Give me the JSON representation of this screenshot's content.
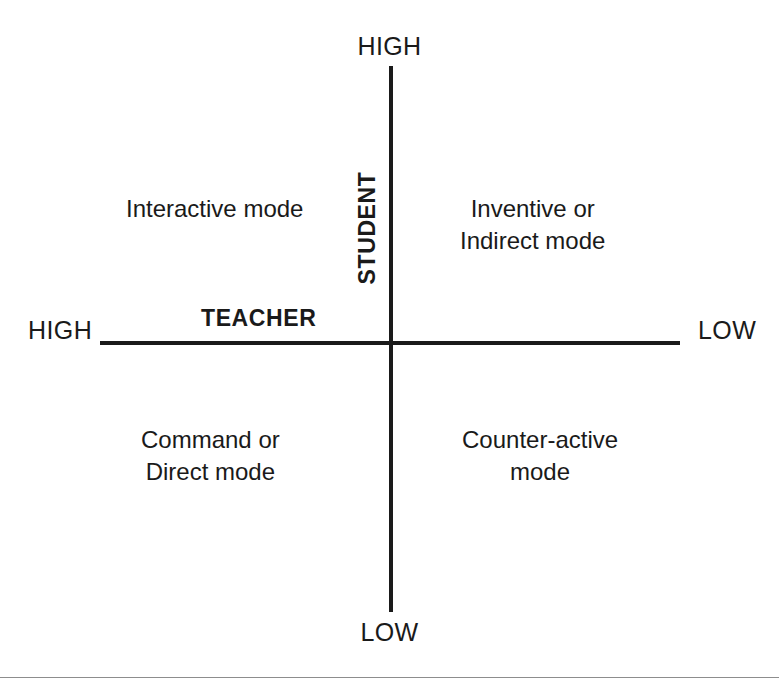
{
  "figure": {
    "type": "2x2-quadrant-matrix",
    "background_color": "#ffffff",
    "ink_color": "#1a1a1a",
    "rule_color": "#8d8d8d"
  },
  "axes": {
    "vertical": {
      "name": "STUDENT",
      "high_label": "HIGH",
      "low_label": "LOW",
      "high_position": "top",
      "low_position": "bottom"
    },
    "horizontal": {
      "name": "TEACHER",
      "high_label": "HIGH",
      "low_label": "LOW",
      "high_position": "left",
      "low_position": "right"
    }
  },
  "quadrants": {
    "top_left": {
      "student": "HIGH",
      "teacher": "HIGH",
      "line1": "Interactive mode",
      "line2": ""
    },
    "top_right": {
      "student": "HIGH",
      "teacher": "LOW",
      "line1": "Inventive or",
      "line2": "Indirect mode"
    },
    "bottom_left": {
      "student": "LOW",
      "teacher": "HIGH",
      "line1": "Command or",
      "line2": "Direct mode"
    },
    "bottom_right": {
      "student": "LOW",
      "teacher": "LOW",
      "line1": "Counter-active",
      "line2": "mode"
    }
  }
}
